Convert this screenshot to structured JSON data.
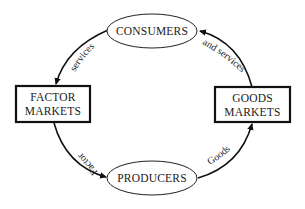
{
  "diagram": {
    "type": "circular-flow",
    "nodes": {
      "consumers": {
        "label": "CONSUMERS",
        "shape": "ellipse"
      },
      "producers": {
        "label": "PRODUCERS",
        "shape": "ellipse"
      },
      "factor_markets": {
        "line1": "FACTOR",
        "line2": "MARKETS",
        "shape": "box"
      },
      "goods_markets": {
        "line1": "GOODS",
        "line2": "MARKETS",
        "shape": "box"
      }
    },
    "edges": {
      "consumers_to_factor": {
        "label": "services",
        "from": "CONSUMERS",
        "to": "FACTOR MARKETS"
      },
      "factor_to_producers": {
        "label": "Factor",
        "from": "FACTOR MARKETS",
        "to": "PRODUCERS"
      },
      "producers_to_goods": {
        "label": "Goods",
        "from": "PRODUCERS",
        "to": "GOODS MARKETS"
      },
      "goods_to_consumers": {
        "label": "and services",
        "from": "GOODS MARKETS",
        "to": "CONSUMERS"
      }
    },
    "colors": {
      "stroke": "#111111",
      "text": "#1a1a1a",
      "background": "#ffffff"
    }
  }
}
